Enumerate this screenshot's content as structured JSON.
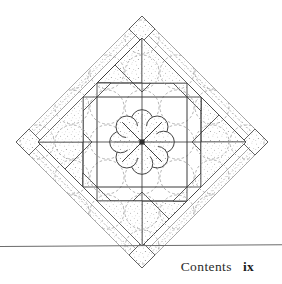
{
  "page": {
    "width": 282,
    "height": 284,
    "background_color": "#ffffff"
  },
  "footer": {
    "rule": {
      "color": "#6b6b6b",
      "thickness_px": 1,
      "y": 246
    },
    "running_head": "Contents",
    "folio": "ix"
  },
  "figure": {
    "name": "quilt-block-diagram",
    "ink_color": "#3a3a3a",
    "stipple_color": "#8a8a8a",
    "dashed_color": "#999999",
    "center": {
      "x": 142,
      "y": 142
    },
    "outer_half_diagonal": 126,
    "geometry": {
      "outer_diamond_half": 126,
      "sawtooth_band_inner_half": 113,
      "plain_band_inner_half": 104,
      "triangle_ring_inner_half": 70,
      "inner_square_half": 45,
      "rosette_radius": 27,
      "petal_count": 8,
      "spoke_count": 8,
      "corner_tip_square_half": 13,
      "dashed_circle_radius": 17
    }
  }
}
